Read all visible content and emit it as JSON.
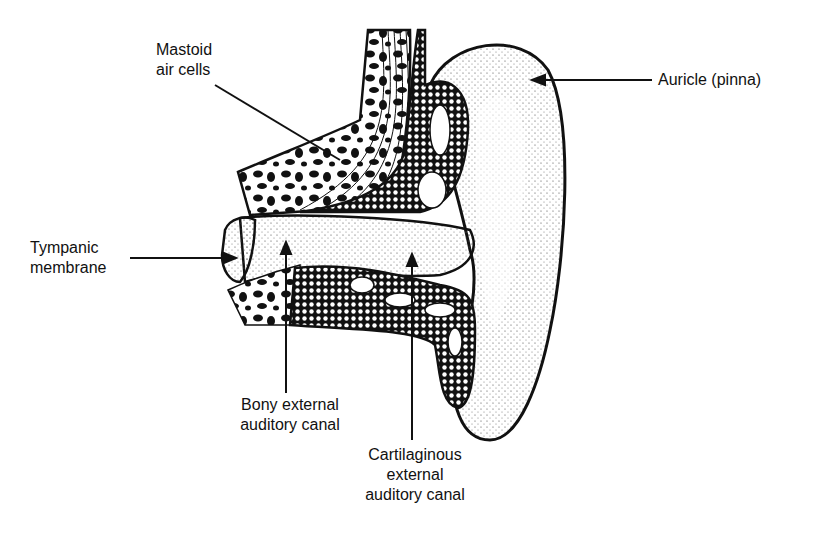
{
  "diagram": {
    "type": "anatomical-cross-section",
    "colors": {
      "ink": "#111111",
      "background": "#ffffff",
      "stipple": "#444444"
    },
    "labels": [
      {
        "id": "mastoid",
        "text": "Mastoid\nair cells"
      },
      {
        "id": "auricle",
        "text": "Auricle (pinna)"
      },
      {
        "id": "tympanic",
        "text": "Tympanic\nmembrane"
      },
      {
        "id": "bony",
        "text": "Bony external\nauditory canal"
      },
      {
        "id": "cartilaginous",
        "text": "Cartilaginous\nexternal\nauditory canal"
      }
    ]
  }
}
